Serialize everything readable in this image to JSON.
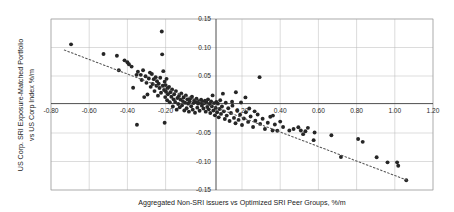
{
  "chart_data": {
    "type": "scatter",
    "title": "",
    "xlabel": "Aggregated Non-SRI issuers vs Optimized SRI Peer Groups, %/m",
    "ylabel_line1": "US Corp. SRI Exposure-Matched Portfolio",
    "ylabel_line2": "vs US Corp Index %/m",
    "xlim": [
      -0.8,
      1.2
    ],
    "ylim": [
      -0.15,
      0.15
    ],
    "xticks": [
      -0.8,
      -0.6,
      -0.4,
      -0.2,
      0.2,
      0.4,
      0.6,
      0.8,
      1.0,
      1.2
    ],
    "yticks": [
      0.15,
      0.1,
      0.05,
      -0.05,
      -0.1,
      -0.15
    ],
    "xtick_labels": [
      "-0.80",
      "-0.60",
      "-0.40",
      "-0.20",
      "0.20",
      "0.40",
      "0.60",
      "0.80",
      "1.00",
      "1.20"
    ],
    "ytick_labels": [
      "0.15",
      "0.10",
      "0.05",
      "-0.05",
      "-0.10",
      "-0.15"
    ],
    "grid": true,
    "legend": "none",
    "marker_color": "#262626",
    "trendline": {
      "style": "dotted",
      "color": "#555555",
      "x0": -0.73,
      "y0": 0.0955,
      "x1": 1.07,
      "y1": -0.1335
    },
    "points": [
      [
        -0.695,
        0.1055
      ],
      [
        -0.525,
        0.0885
      ],
      [
        -0.455,
        0.0855
      ],
      [
        -0.445,
        0.06
      ],
      [
        -0.415,
        0.0775
      ],
      [
        -0.4,
        0.074
      ],
      [
        -0.392,
        0.0705
      ],
      [
        -0.378,
        0.0665
      ],
      [
        -0.37,
        0.0295
      ],
      [
        -0.352,
        0.052
      ],
      [
        -0.345,
        0.0575
      ],
      [
        -0.33,
        0.052
      ],
      [
        -0.325,
        0.043
      ],
      [
        -0.318,
        0.06
      ],
      [
        -0.305,
        0.0495
      ],
      [
        -0.3,
        0.038
      ],
      [
        -0.295,
        0.0175
      ],
      [
        -0.288,
        0.0455
      ],
      [
        -0.282,
        0.056
      ],
      [
        -0.278,
        0.031
      ],
      [
        -0.272,
        0.0535
      ],
      [
        -0.268,
        0.036
      ],
      [
        -0.262,
        0.0445
      ],
      [
        -0.258,
        0.0235
      ],
      [
        -0.252,
        0.048
      ],
      [
        -0.248,
        0.033
      ],
      [
        -0.245,
        0.041
      ],
      [
        -0.24,
        0.0155
      ],
      [
        -0.236,
        0.0365
      ],
      [
        -0.232,
        0.029
      ],
      [
        -0.228,
        0.047
      ],
      [
        -0.224,
        0.0205
      ],
      [
        -0.22,
        0.128
      ],
      [
        -0.218,
        0.088
      ],
      [
        -0.215,
        0.033
      ],
      [
        -0.212,
        0.0585
      ],
      [
        -0.208,
        0.0255
      ],
      [
        -0.205,
        0.04
      ],
      [
        -0.202,
        0.013
      ],
      [
        -0.2,
        0.034
      ],
      [
        -0.198,
        0.0225
      ],
      [
        -0.195,
        0.045
      ],
      [
        -0.192,
        0.0075
      ],
      [
        -0.19,
        0.0285
      ],
      [
        -0.188,
        0.018
      ],
      [
        -0.205,
        -0.032
      ],
      [
        -0.35,
        -0.0355
      ],
      [
        -0.312,
        0.013
      ],
      [
        -0.182,
        0.031
      ],
      [
        -0.178,
        0.004
      ],
      [
        -0.175,
        0.0215
      ],
      [
        -0.17,
        0.0135
      ],
      [
        -0.166,
        0.0265
      ],
      [
        -0.162,
        -0.0035
      ],
      [
        -0.158,
        0.009
      ],
      [
        -0.155,
        0.018
      ],
      [
        -0.15,
        0.0045
      ],
      [
        -0.146,
        0.0235
      ],
      [
        -0.142,
        -0.009
      ],
      [
        -0.138,
        0.0115
      ],
      [
        -0.134,
        0.001
      ],
      [
        -0.13,
        0.015
      ],
      [
        -0.126,
        -0.005
      ],
      [
        -0.122,
        0.0085
      ],
      [
        -0.118,
        0.0195
      ],
      [
        -0.114,
        -0.0015
      ],
      [
        -0.11,
        0.006
      ],
      [
        -0.106,
        0.0125
      ],
      [
        -0.102,
        -0.0105
      ],
      [
        -0.098,
        0.003
      ],
      [
        -0.094,
        0.016
      ],
      [
        -0.09,
        -0.0065
      ],
      [
        -0.086,
        0.009
      ],
      [
        -0.082,
        0.0015
      ],
      [
        -0.078,
        -0.0125
      ],
      [
        -0.074,
        0.0055
      ],
      [
        -0.07,
        0.011
      ],
      [
        -0.066,
        -0.003
      ],
      [
        -0.062,
        0.0135
      ],
      [
        -0.058,
        -0.009
      ],
      [
        -0.054,
        0.0025
      ],
      [
        -0.05,
        0.007
      ],
      [
        -0.046,
        -0.0145
      ],
      [
        -0.042,
        0.0045
      ],
      [
        -0.038,
        0.01
      ],
      [
        -0.034,
        -0.0055
      ],
      [
        -0.03,
        0.0015
      ],
      [
        -0.026,
        0.006
      ],
      [
        -0.022,
        -0.011
      ],
      [
        -0.018,
        0.003
      ],
      [
        -0.014,
        0.0085
      ],
      [
        -0.01,
        -0.002
      ],
      [
        -0.006,
        0.005
      ],
      [
        -0.002,
        -0.007
      ],
      [
        0.002,
        0.002
      ],
      [
        0.006,
        0.0065
      ],
      [
        0.01,
        -0.0125
      ],
      [
        0.014,
        0.0035
      ],
      [
        0.018,
        -0.0045
      ],
      [
        0.022,
        0.009
      ],
      [
        0.026,
        -0.0085
      ],
      [
        0.03,
        0.001
      ],
      [
        0.034,
        -0.015
      ],
      [
        0.038,
        0.0055
      ],
      [
        0.042,
        -0.003
      ],
      [
        0.046,
        0.016
      ],
      [
        0.05,
        -0.0105
      ],
      [
        0.054,
        0.0025
      ],
      [
        0.058,
        -0.019
      ],
      [
        0.062,
        -0.006
      ],
      [
        0.066,
        0.0045
      ],
      [
        0.07,
        -0.0135
      ],
      [
        0.074,
        0.0015
      ],
      [
        0.078,
        -0.0225
      ],
      [
        0.082,
        -0.008
      ],
      [
        0.086,
        0.0075
      ],
      [
        0.09,
        -0.0165
      ],
      [
        0.095,
        -0.0035
      ],
      [
        0.1,
        0.019
      ],
      [
        0.105,
        -0.012
      ],
      [
        0.11,
        -0.0255
      ],
      [
        0.115,
        0.003
      ],
      [
        0.12,
        -0.0195
      ],
      [
        0.128,
        -0.0065
      ],
      [
        0.135,
        -0.029
      ],
      [
        0.142,
        -0.015
      ],
      [
        0.15,
        -0.002
      ],
      [
        0.158,
        -0.0235
      ],
      [
        0.166,
        -0.033
      ],
      [
        0.175,
        -0.0105
      ],
      [
        0.182,
        -0.027
      ],
      [
        0.19,
        -0.018
      ],
      [
        0.2,
        -0.036
      ],
      [
        0.21,
        -0.0245
      ],
      [
        0.22,
        -0.0135
      ],
      [
        0.232,
        -0.0305
      ],
      [
        0.245,
        -0.021
      ],
      [
        0.258,
        -0.0395
      ],
      [
        0.27,
        -0.0285
      ],
      [
        0.282,
        -0.0175
      ],
      [
        0.295,
        -0.034
      ],
      [
        0.308,
        -0.025
      ],
      [
        0.32,
        -0.043
      ],
      [
        0.335,
        -0.032
      ],
      [
        0.348,
        -0.0215
      ],
      [
        0.36,
        -0.0455
      ],
      [
        0.218,
        0.0125
      ],
      [
        0.168,
        0.0215
      ],
      [
        0.292,
        0.048
      ],
      [
        0.148,
        0.005
      ],
      [
        0.372,
        -0.035
      ],
      [
        0.385,
        -0.046
      ],
      [
        0.4,
        -0.03
      ],
      [
        0.415,
        -0.0395
      ],
      [
        0.448,
        -0.0455
      ],
      [
        0.47,
        -0.043
      ],
      [
        0.495,
        -0.04
      ],
      [
        0.508,
        -0.0455
      ],
      [
        0.52,
        -0.052
      ],
      [
        0.532,
        -0.047
      ],
      [
        0.545,
        -0.041
      ],
      [
        0.575,
        -0.0625
      ],
      [
        0.58,
        -0.049
      ],
      [
        0.668,
        -0.054
      ],
      [
        0.718,
        -0.092
      ],
      [
        0.808,
        -0.0605
      ],
      [
        0.832,
        -0.0655
      ],
      [
        0.905,
        -0.0925
      ],
      [
        0.962,
        -0.1015
      ],
      [
        1.012,
        -0.1015
      ],
      [
        1.018,
        -0.1075
      ],
      [
        1.06,
        -0.133
      ],
      [
        0.362,
        -0.0195
      ],
      [
        0.238,
        -0.007
      ],
      [
        0.266,
        -0.012
      ],
      [
        0.195,
        0.0035
      ]
    ]
  }
}
